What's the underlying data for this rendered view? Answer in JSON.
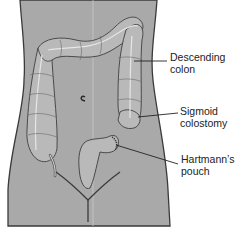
{
  "figure": {
    "colors": {
      "body": "#a9a9a9",
      "outline": "#3a3a3a",
      "colon_fill": "#b9b9b9",
      "colon_highlight": "#d6d6d6",
      "background": "#ffffff",
      "text": "#222222"
    },
    "labels": [
      {
        "id": "descending-colon",
        "lines": [
          "Descending",
          "colon"
        ]
      },
      {
        "id": "sigmoid-colostomy",
        "lines": [
          "Sigmoid",
          "colostomy"
        ]
      },
      {
        "id": "hartmanns-pouch",
        "lines": [
          "Hartmann’s",
          "pouch"
        ]
      }
    ]
  }
}
